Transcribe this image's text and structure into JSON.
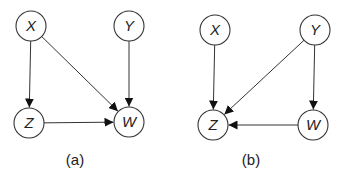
{
  "colors": {
    "stroke": "#333333",
    "text": "#222222",
    "background": "#ffffff"
  },
  "diagrams": [
    {
      "caption": "(a)",
      "nodes": {
        "X": {
          "label": "X",
          "cx": 31,
          "cy": 26
        },
        "Y": {
          "label": "Y",
          "cx": 129,
          "cy": 26
        },
        "Z": {
          "label": "Z",
          "cx": 29,
          "cy": 123
        },
        "W": {
          "label": "W",
          "cx": 129,
          "cy": 122
        }
      },
      "edges": [
        {
          "from": "X",
          "to": "Z"
        },
        {
          "from": "X",
          "to": "W"
        },
        {
          "from": "Y",
          "to": "W"
        },
        {
          "from": "Z",
          "to": "W"
        }
      ],
      "caption_pos": {
        "x": 75,
        "y": 165
      }
    },
    {
      "caption": "(b)",
      "nodes": {
        "X": {
          "label": "X",
          "cx": 215,
          "cy": 30
        },
        "Y": {
          "label": "Y",
          "cx": 315,
          "cy": 30
        },
        "Z": {
          "label": "Z",
          "cx": 213,
          "cy": 125
        },
        "W": {
          "label": "W",
          "cx": 313,
          "cy": 125
        }
      },
      "edges": [
        {
          "from": "X",
          "to": "Z"
        },
        {
          "from": "Y",
          "to": "Z"
        },
        {
          "from": "Y",
          "to": "W"
        },
        {
          "from": "W",
          "to": "Z"
        }
      ],
      "caption_pos": {
        "x": 251,
        "y": 165
      }
    }
  ],
  "node_radius": 15
}
